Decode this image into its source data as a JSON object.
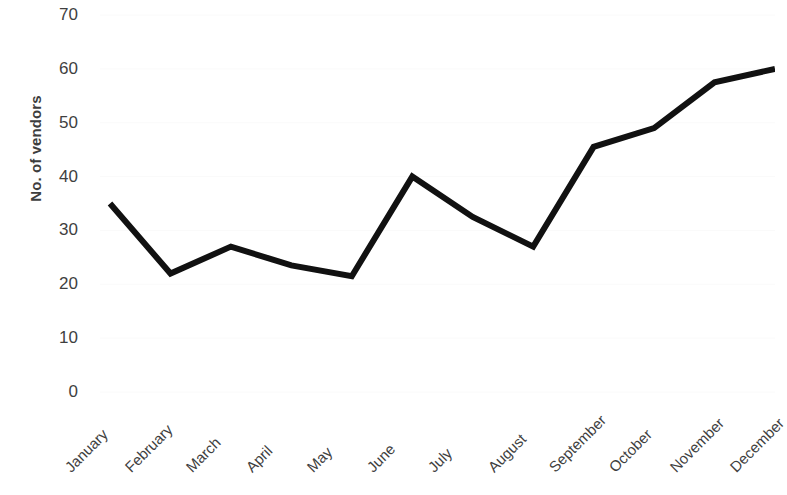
{
  "chart_data": {
    "type": "line",
    "title": "",
    "xlabel": "",
    "ylabel": "No. of vendors",
    "categories": [
      "January",
      "February",
      "March",
      "April",
      "May",
      "June",
      "July",
      "August",
      "September",
      "October",
      "November",
      "December"
    ],
    "values": [
      35,
      22,
      27,
      23.5,
      21.5,
      40,
      32.5,
      27,
      45.5,
      49,
      57.5,
      60
    ],
    "series": [
      {
        "name": "No. of vendors",
        "values": [
          35,
          22,
          27,
          23.5,
          21.5,
          40,
          32.5,
          27,
          45.5,
          49,
          57.5,
          60
        ]
      }
    ],
    "ylim": [
      0,
      70
    ],
    "y_ticks": [
      70,
      60,
      50,
      40,
      30,
      20,
      10,
      0
    ],
    "y_tick_labels": [
      "70",
      "60",
      "50",
      "40",
      "30",
      "20",
      "10",
      "0"
    ],
    "grid": true,
    "grid_axis": "y",
    "grid_color": "#fafafa",
    "legend": false,
    "legend_position": "none",
    "line_color": "#111111",
    "line_width_px": 6,
    "background_color": "#ffffff",
    "markers": false,
    "x_tick_rotation_deg": -45
  },
  "axes": {
    "y_title": "No. of vendors"
  }
}
